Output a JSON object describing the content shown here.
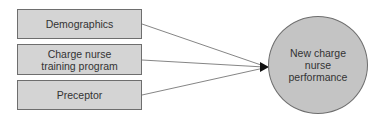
{
  "diagram": {
    "inputs": [
      {
        "label": "Demographics"
      },
      {
        "label": "Charge nurse training program"
      },
      {
        "label": "Preceptor"
      }
    ],
    "outcome": {
      "label": "New charge nurse performance"
    },
    "colors": {
      "box_fill": "#d4d4d4",
      "circle_fill": "#c4c4c4",
      "stroke": "#6e6e6e",
      "line": "#555555"
    }
  }
}
